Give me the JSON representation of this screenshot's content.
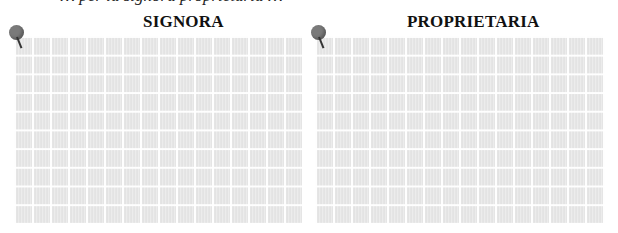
{
  "header": {
    "partial_text": "… per la signora proprietaria …"
  },
  "panels": [
    {
      "title": "SIGNORA",
      "pin_icon": "pushpin-icon",
      "background": "grid"
    },
    {
      "title": "PROPRIETARIA",
      "pin_icon": "pushpin-icon",
      "background": "grid"
    }
  ],
  "colors": {
    "panel_fill": "#e6e6e6",
    "grid_line": "#ffffff",
    "pin_head": "#7a7a7a",
    "title": "#111111"
  }
}
